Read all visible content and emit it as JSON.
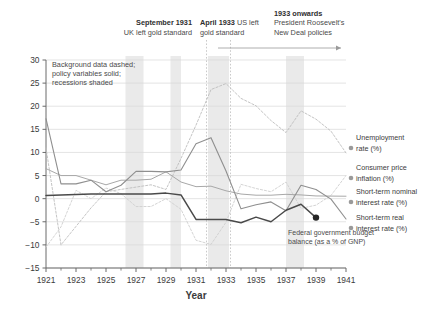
{
  "chart_data": {
    "type": "line",
    "title": "",
    "xlabel": "Year",
    "ylabel": "",
    "xlim": [
      1921,
      1941
    ],
    "ylim": [
      -15,
      30
    ],
    "grid": true,
    "legend_position": "right",
    "x_ticks": [
      "1921",
      "1923",
      "1925",
      "1927",
      "1929",
      "1931",
      "1933",
      "1935",
      "1937",
      "1939",
      "1941"
    ],
    "x_minor_ticks": [
      1922,
      1924,
      1926,
      1928,
      1930,
      1932,
      1934,
      1936,
      1938,
      1940
    ],
    "y_ticks": [
      "30",
      "25",
      "20",
      "15",
      "10",
      "5",
      "0",
      "-5",
      "-10",
      "-15"
    ],
    "x": [
      1921,
      1922,
      1923,
      1924,
      1925,
      1926,
      1927,
      1928,
      1929,
      1930,
      1931,
      1932,
      1933,
      1934,
      1935,
      1936,
      1937,
      1938,
      1939,
      1940,
      1941
    ],
    "series": [
      {
        "name": "Unemployment rate (%)",
        "style": "dashed",
        "label_line1": "Unemployment",
        "label_line2": "rate (%)",
        "values": [
          11.0,
          -10.0,
          -6.0,
          -2.0,
          1.5,
          2.0,
          2.5,
          3.0,
          2.0,
          8.7,
          15.9,
          23.6,
          24.9,
          21.7,
          20.1,
          16.9,
          14.3,
          19.0,
          17.2,
          14.6,
          9.9
        ]
      },
      {
        "name": "Consumer price inflation (%)",
        "style": "dashed",
        "label_line1": "Consumer price",
        "label_line2": "inflation (%)",
        "values": [
          -10.5,
          -6.1,
          1.8,
          0.0,
          2.3,
          1.1,
          -1.7,
          -1.7,
          0.0,
          -2.3,
          -9.0,
          -9.9,
          -5.1,
          3.1,
          2.2,
          1.5,
          3.6,
          -2.1,
          -1.4,
          0.7,
          5.0
        ]
      },
      {
        "name": "Short-term nominal interest rate (%)",
        "style": "solid",
        "label_line1": "Short-term nominal",
        "label_line2": "interest rate (%)",
        "values": [
          6.5,
          5.0,
          5.0,
          4.0,
          3.0,
          4.0,
          4.0,
          4.2,
          5.8,
          3.6,
          2.6,
          2.7,
          1.7,
          1.0,
          0.75,
          0.75,
          0.94,
          0.81,
          0.59,
          0.56,
          0.53
        ]
      },
      {
        "name": "Short-term real interest rate (%)",
        "style": "solid",
        "label_line1": "Short-term real",
        "label_line2": "interest rate (%)",
        "values": [
          17.3,
          3.2,
          3.2,
          4.0,
          1.5,
          2.9,
          5.9,
          5.9,
          5.8,
          6.2,
          11.9,
          13.2,
          6.0,
          -2.2,
          -1.3,
          -0.7,
          -2.6,
          2.9,
          2.0,
          -0.1,
          -4.4
        ]
      },
      {
        "name": "Federal government budget balance (as a % of GNP)",
        "style": "solid-dark",
        "label_line1": "Federal government budget",
        "label_line2": "balance (as a % of GNP)",
        "values": [
          0.7,
          0.8,
          0.9,
          1.0,
          1.0,
          1.0,
          1.0,
          1.0,
          1.2,
          0.8,
          -4.5,
          -4.5,
          -4.5,
          -5.2,
          -4.0,
          -5.0,
          -2.5,
          -1.2,
          -4.1,
          null,
          null
        ]
      }
    ],
    "endpoint_marker": {
      "x": 1939,
      "y": -4.1,
      "series": "Federal government budget balance (as a % of GNP)"
    },
    "recession_bands": [
      {
        "start": 1926.3,
        "end": 1927.5
      },
      {
        "start": 1929.3,
        "end": 1930.0
      },
      {
        "start": 1931.8,
        "end": 1933.2
      },
      {
        "start": 1937.0,
        "end": 1938.2
      }
    ],
    "event_lines": [
      {
        "x": 1931.7,
        "label": "September 1931"
      },
      {
        "x": 1933.3,
        "label": "April 1933"
      }
    ],
    "annotations": [
      {
        "id": "plot-note",
        "line1": "Background data dashed;",
        "line2": "policy variables solid;",
        "line3": "recessions shaded"
      },
      {
        "id": "sept-1931",
        "bold": "September 1931",
        "rest": "",
        "line2": "UK left gold standard"
      },
      {
        "id": "april-1933",
        "bold": "April 1933",
        "rest": " US left",
        "line2": "gold standard"
      },
      {
        "id": "new-deal",
        "bold": "1933 onwards",
        "rest": "",
        "line2": "President Roosevelt's",
        "line3": "New Deal policies"
      }
    ],
    "colors": {
      "axis": "#6b6b6b",
      "grid": "#d9d9d9",
      "recession_band": "#eaeaea",
      "event_line": "#bdbdbd",
      "unemployment": "#bdbdbd",
      "inflation": "#cfcfcf",
      "nominal_rate": "#a8a8a8",
      "real_rate": "#8f8f8f",
      "budget_balance": "#4a4a4a",
      "text": "#3b3b3b",
      "legend_marker": "#9a9a9a"
    }
  }
}
